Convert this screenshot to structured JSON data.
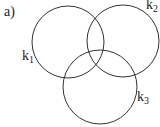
{
  "figure": {
    "label": "a)",
    "circles": [
      {
        "name": "k",
        "sub": "1",
        "cx": 68,
        "cy": 42,
        "r": 36
      },
      {
        "name": "k",
        "sub": "2",
        "cx": 123,
        "cy": 41,
        "r": 36
      },
      {
        "name": "k",
        "sub": "3",
        "cx": 100,
        "cy": 87,
        "r": 37
      }
    ],
    "stroke": "#333333"
  }
}
